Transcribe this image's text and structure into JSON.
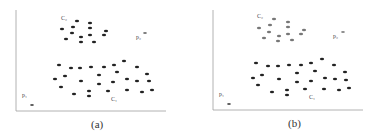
{
  "figure": {
    "panels": [
      {
        "id": "a",
        "caption": "(a)",
        "labels": {
          "c2": "C₂",
          "c1": "C₁",
          "p1": "p₁",
          "p2": "p₂"
        },
        "colors": {
          "c1": "#222222",
          "c2": "#222222",
          "p1": "#555555",
          "p2": "#777777",
          "axis": "#999999"
        },
        "c2_points": [
          [
            77,
            21
          ],
          [
            90,
            23
          ],
          [
            73,
            27
          ],
          [
            90,
            28
          ],
          [
            62,
            29
          ],
          [
            106,
            31
          ],
          [
            72,
            33
          ],
          [
            90,
            35
          ],
          [
            81,
            37
          ],
          [
            104,
            35
          ],
          [
            66,
            39
          ],
          [
            81,
            42
          ],
          [
            94,
            42
          ]
        ],
        "c1_points": [
          [
            124,
            61
          ],
          [
            59,
            65
          ],
          [
            71,
            68
          ],
          [
            80,
            68
          ],
          [
            91,
            67
          ],
          [
            104,
            67
          ],
          [
            114,
            65
          ],
          [
            137,
            67
          ],
          [
            117,
            72
          ],
          [
            99,
            75
          ],
          [
            147,
            74
          ],
          [
            65,
            76
          ],
          [
            55,
            79
          ],
          [
            81,
            81
          ],
          [
            127,
            79
          ],
          [
            137,
            81
          ],
          [
            149,
            81
          ],
          [
            113,
            82
          ],
          [
            99,
            84
          ],
          [
            61,
            87
          ],
          [
            89,
            91
          ],
          [
            74,
            94
          ],
          [
            108,
            91
          ],
          [
            127,
            90
          ],
          [
            142,
            92
          ],
          [
            152,
            90
          ],
          [
            89,
            96
          ]
        ],
        "p1_point": [
          32,
          105
        ],
        "p2_point": [
          145,
          33
        ]
      },
      {
        "id": "b",
        "caption": "(b)",
        "labels": {
          "c2": "C₂",
          "c1": "C₁",
          "p1": "p₁",
          "p2": "p₂"
        },
        "colors": {
          "c1": "#222222",
          "c2": "#777777",
          "p1": "#555555",
          "p2": "#888888",
          "axis": "#999999"
        },
        "c2_points": [
          [
            274,
            19
          ],
          [
            288,
            22
          ],
          [
            270,
            25
          ],
          [
            288,
            27
          ],
          [
            259,
            28
          ],
          [
            304,
            30
          ],
          [
            269,
            32
          ],
          [
            288,
            34
          ],
          [
            279,
            36
          ],
          [
            301,
            34
          ],
          [
            264,
            38
          ],
          [
            278,
            41
          ],
          [
            292,
            40
          ]
        ],
        "c1_points": [
          [
            322,
            59
          ],
          [
            256,
            63
          ],
          [
            268,
            66
          ],
          [
            278,
            66
          ],
          [
            289,
            65
          ],
          [
            301,
            65
          ],
          [
            311,
            63
          ],
          [
            334,
            65
          ],
          [
            315,
            71
          ],
          [
            297,
            73
          ],
          [
            345,
            72
          ],
          [
            262,
            75
          ],
          [
            253,
            78
          ],
          [
            279,
            79
          ],
          [
            325,
            78
          ],
          [
            335,
            79
          ],
          [
            346,
            80
          ],
          [
            311,
            81
          ],
          [
            297,
            82
          ],
          [
            258,
            85
          ],
          [
            287,
            90
          ],
          [
            272,
            92
          ],
          [
            305,
            89
          ],
          [
            324,
            89
          ],
          [
            339,
            90
          ],
          [
            349,
            88
          ],
          [
            287,
            95
          ]
        ],
        "p1_point": [
          229,
          104
        ],
        "p2_point": [
          343,
          32
        ]
      }
    ]
  }
}
